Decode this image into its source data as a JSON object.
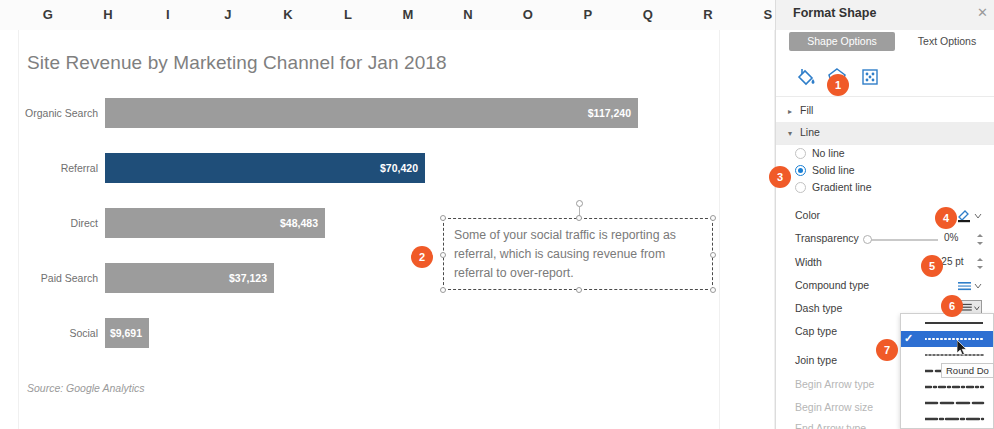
{
  "spreadsheet": {
    "columns": [
      "G",
      "H",
      "I",
      "J",
      "K",
      "L",
      "M",
      "N",
      "O",
      "P",
      "Q",
      "R",
      "S"
    ]
  },
  "chart_data": {
    "type": "bar",
    "orientation": "horizontal",
    "title": "Site Revenue by Marketing Channel for Jan 2018",
    "source_note": "Source: Google Analytics",
    "xlabel": "",
    "ylabel": "",
    "categories": [
      "Organic Search",
      "Referral",
      "Direct",
      "Paid Search",
      "Social"
    ],
    "values": [
      117240,
      70420,
      48483,
      37123,
      9691
    ],
    "value_labels": [
      "$117,240",
      "$70,420",
      "$48,483",
      "$37,123",
      "$9,691"
    ],
    "colors": [
      "#9c9c9c",
      "#1f4e79",
      "#9c9c9c",
      "#9c9c9c",
      "#9c9c9c"
    ],
    "highlight_category": "Referral",
    "highlight_color": "#1f4e79",
    "base_color": "#9c9c9c",
    "grid": false,
    "legend": "none",
    "xlim": [
      0,
      125000
    ]
  },
  "textbox": {
    "text": "Some of your social traffic is reporting as referral, which is causing revenue from referral to over-report.",
    "selected": true
  },
  "panel": {
    "title": "Format Shape",
    "close_label": "✕",
    "tabs": [
      {
        "label": "Shape Options",
        "active": true
      },
      {
        "label": "Text Options",
        "active": false
      }
    ],
    "icons": [
      {
        "name": "fill-line-icon"
      },
      {
        "name": "effects-icon"
      },
      {
        "name": "size-properties-icon"
      }
    ],
    "sections": [
      {
        "label": "Fill",
        "open": false
      },
      {
        "label": "Line",
        "open": true
      }
    ],
    "line_options": [
      {
        "label": "No line",
        "selected": false
      },
      {
        "label": "Solid line",
        "selected": true
      },
      {
        "label": "Gradient line",
        "selected": false
      }
    ],
    "properties": [
      {
        "label": "Color",
        "value": "",
        "dim": false
      },
      {
        "label": "Transparency",
        "value": "0%",
        "dim": false
      },
      {
        "label": "Width",
        "value": "2.25 pt",
        "dim": false
      },
      {
        "label": "Compound type",
        "value": "",
        "dim": false
      },
      {
        "label": "Dash type",
        "value": "",
        "dim": false
      },
      {
        "label": "Cap type",
        "value": "",
        "dim": false
      },
      {
        "label": "Join type",
        "value": "",
        "dim": false
      },
      {
        "label": "Begin Arrow type",
        "value": "",
        "dim": true
      },
      {
        "label": "Begin Arrow size",
        "value": "",
        "dim": true
      },
      {
        "label": "End Arrow type",
        "value": "",
        "dim": true
      }
    ],
    "dash_dropdown": {
      "open": true,
      "selected_index": 1,
      "tooltip": "Round Do",
      "items": [
        "solid",
        "round-dot",
        "square-dot",
        "dash",
        "dash-dot",
        "long-dash",
        "long-dash-dot"
      ]
    }
  },
  "callouts": [
    {
      "number": "1",
      "x": 827,
      "y": 74
    },
    {
      "number": "2",
      "x": 411,
      "y": 246
    },
    {
      "number": "3",
      "x": 769,
      "y": 166
    },
    {
      "number": "4",
      "x": 935,
      "y": 207
    },
    {
      "number": "5",
      "x": 921,
      "y": 255
    },
    {
      "number": "6",
      "x": 941,
      "y": 295
    },
    {
      "number": "7",
      "x": 876,
      "y": 339
    }
  ]
}
